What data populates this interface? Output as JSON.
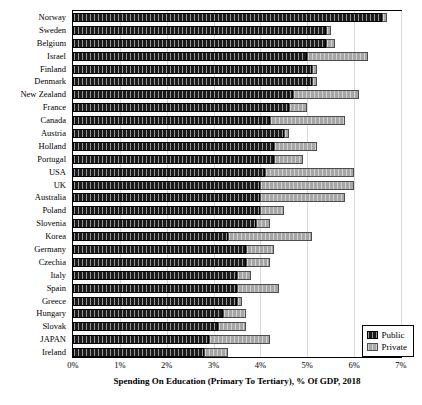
{
  "chart_data": {
    "type": "bar",
    "orientation": "horizontal",
    "stacked": true,
    "title": "",
    "xlabel": "Spending On Education (Primary To Tertiary), % Of GDP, 2018",
    "ylabel": "",
    "xlim": [
      0,
      7
    ],
    "xticks": [
      "0%",
      "1%",
      "2%",
      "3%",
      "4%",
      "5%",
      "6%",
      "7%"
    ],
    "xtick_values": [
      0,
      1,
      2,
      3,
      4,
      5,
      6,
      7
    ],
    "grid": true,
    "legend_position": "bottom-right",
    "categories": [
      "Norway",
      "Sweden",
      "Belgium",
      "Israel",
      "Finland",
      "Denmark",
      "New Zealand",
      "France",
      "Canada",
      "Austria",
      "Holland",
      "Portugal",
      "USA",
      "UK",
      "Australia",
      "Poland",
      "Slovenia",
      "Korea",
      "Germany",
      "Czechia",
      "Italy",
      "Spain",
      "Greece",
      "Hungary",
      "Slovak",
      "JAPAN",
      "Ireland"
    ],
    "series": [
      {
        "name": "Public",
        "color": "#1a1a1a",
        "values": [
          6.6,
          5.4,
          5.4,
          5.0,
          5.1,
          5.1,
          4.7,
          4.6,
          4.2,
          4.5,
          4.3,
          4.3,
          4.1,
          4.0,
          4.0,
          4.0,
          3.9,
          3.3,
          3.7,
          3.7,
          3.5,
          3.5,
          3.5,
          3.2,
          3.1,
          2.9,
          2.8
        ]
      },
      {
        "name": "Private",
        "color": "#a6a6a6",
        "values": [
          0.1,
          0.1,
          0.2,
          1.3,
          0.1,
          0.1,
          1.4,
          0.4,
          1.6,
          0.1,
          0.9,
          0.6,
          1.9,
          2.0,
          1.8,
          0.5,
          0.3,
          1.8,
          0.6,
          0.5,
          0.3,
          0.9,
          0.1,
          0.5,
          0.6,
          1.3,
          0.5
        ]
      }
    ],
    "totals": [
      6.7,
      5.5,
      5.6,
      6.3,
      5.2,
      5.2,
      6.1,
      5.0,
      5.8,
      4.6,
      5.2,
      4.9,
      6.0,
      6.0,
      5.8,
      4.5,
      4.2,
      5.1,
      4.3,
      4.2,
      3.8,
      4.4,
      3.6,
      3.7,
      3.7,
      4.2,
      3.3
    ],
    "legend": [
      "Public",
      "Private"
    ]
  }
}
